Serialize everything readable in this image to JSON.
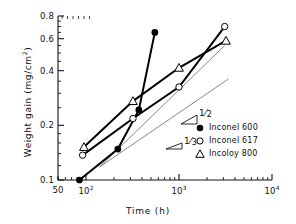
{
  "chart_data": {
    "type": "scatter",
    "title": "",
    "xlabel": "Time (h)",
    "ylabel": "Weight gain (mg/cm2)",
    "ylabel_display": "Weight  gain  (mg/cm",
    "ylabel_sup": "2",
    "ylabel_tail": ")",
    "xscale": "log",
    "yscale": "log",
    "xlim": [
      50,
      10000
    ],
    "ylim": [
      0.1,
      0.8
    ],
    "grid": false,
    "legend_position": "lower right",
    "xticks": [
      {
        "value": 50,
        "label": "50",
        "sup": ""
      },
      {
        "value": 100,
        "label": "10",
        "sup": "2"
      },
      {
        "value": 1000,
        "label": "10",
        "sup": "3"
      },
      {
        "value": 10000,
        "label": "10",
        "sup": "4"
      }
    ],
    "yticks": [
      {
        "value": 0.1,
        "label": "0.1"
      },
      {
        "value": 0.2,
        "label": "0.2"
      },
      {
        "value": 0.4,
        "label": "0.4"
      },
      {
        "value": 0.6,
        "label": "0.6"
      },
      {
        "value": 0.8,
        "label": "0.8"
      }
    ],
    "series": [
      {
        "name": "Inconel 600",
        "marker": "filled-circle",
        "color": "#000000",
        "points": [
          {
            "x": 85,
            "y": 0.1
          },
          {
            "x": 220,
            "y": 0.148
          },
          {
            "x": 370,
            "y": 0.243
          },
          {
            "x": 550,
            "y": 0.65
          }
        ]
      },
      {
        "name": "Inconel 617",
        "marker": "open-circle",
        "color": "#000000",
        "points": [
          {
            "x": 92,
            "y": 0.137
          },
          {
            "x": 320,
            "y": 0.218
          },
          {
            "x": 1000,
            "y": 0.325
          },
          {
            "x": 3100,
            "y": 0.7
          }
        ]
      },
      {
        "name": "Incoloy 800",
        "marker": "open-triangle",
        "color": "#000000",
        "points": [
          {
            "x": 95,
            "y": 0.152
          },
          {
            "x": 320,
            "y": 0.272
          },
          {
            "x": 1000,
            "y": 0.415
          },
          {
            "x": 3200,
            "y": 0.585
          }
        ]
      }
    ],
    "annotations": [
      {
        "label": "1/2",
        "numerator": "1",
        "denominator": "2",
        "slope": 0.5,
        "line_from": {
          "x": 140,
          "y": 0.118
        },
        "line_to": {
          "x": 3100,
          "y": 0.55
        }
      },
      {
        "label": "1/3",
        "numerator": "1",
        "denominator": "3",
        "slope": 0.3333,
        "line_from": {
          "x": 140,
          "y": 0.118
        },
        "line_to": {
          "x": 3400,
          "y": 0.36
        }
      }
    ]
  },
  "legend": {
    "items": [
      {
        "marker": "filled-circle",
        "label": "Inconel 600"
      },
      {
        "marker": "open-circle",
        "label": "Inconel 617"
      },
      {
        "marker": "open-triangle",
        "label": "Incoloy 800"
      }
    ]
  }
}
